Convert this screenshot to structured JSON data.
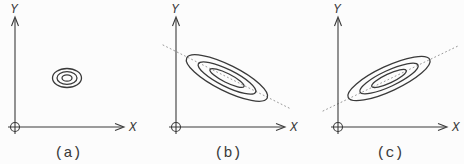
{
  "figure": {
    "width": 464,
    "height": 164,
    "background": "#fcfcfc",
    "ink_color": "#3a3a3a",
    "dotted_line_color": "#999999",
    "origin_marker_icon": "circled-plus"
  },
  "panels": [
    {
      "label": "(a)",
      "x_axis_label": "X",
      "y_axis_label": "Y",
      "origin": {
        "x": 15,
        "y": 127
      },
      "y_axis_top": 17,
      "x_axis_end": 123,
      "x_label_pos": {
        "x": 129,
        "y": 131
      },
      "y_label_pos": {
        "x": 14,
        "y": 13
      },
      "caption_pos": {
        "x": 68,
        "y": 157
      },
      "ellipses": {
        "cx": 67,
        "cy": 78,
        "rotation_deg": 0,
        "contours": [
          [
            14.5,
            9.5
          ],
          [
            10,
            6.3
          ],
          [
            5,
            3.2
          ]
        ]
      },
      "trend_line": null
    },
    {
      "label": "(b)",
      "x_axis_label": "X",
      "y_axis_label": "Y",
      "origin": {
        "x": 176,
        "y": 127
      },
      "y_axis_top": 17,
      "x_axis_end": 284,
      "x_label_pos": {
        "x": 290,
        "y": 131
      },
      "y_label_pos": {
        "x": 175,
        "y": 13
      },
      "caption_pos": {
        "x": 228,
        "y": 157
      },
      "ellipses": {
        "cx": 227,
        "cy": 78,
        "rotation_deg": 26.5,
        "contours": [
          [
            45,
            13
          ],
          [
            32,
            8.5
          ],
          [
            19,
            4.5
          ]
        ]
      },
      "trend_line": {
        "x1": 163,
        "y1": 45,
        "x2": 291,
        "y2": 109
      }
    },
    {
      "label": "(c)",
      "x_axis_label": "X",
      "y_axis_label": "Y",
      "origin": {
        "x": 338,
        "y": 127
      },
      "y_axis_top": 17,
      "x_axis_end": 446,
      "x_label_pos": {
        "x": 452,
        "y": 131
      },
      "y_label_pos": {
        "x": 337,
        "y": 13
      },
      "caption_pos": {
        "x": 390,
        "y": 157
      },
      "ellipses": {
        "cx": 389,
        "cy": 78.5,
        "rotation_deg": -25,
        "contours": [
          [
            45,
            12.5
          ],
          [
            32,
            8
          ],
          [
            19,
            4.5
          ]
        ]
      },
      "trend_line": {
        "x1": 323,
        "y1": 111,
        "x2": 458,
        "y2": 46
      }
    }
  ]
}
